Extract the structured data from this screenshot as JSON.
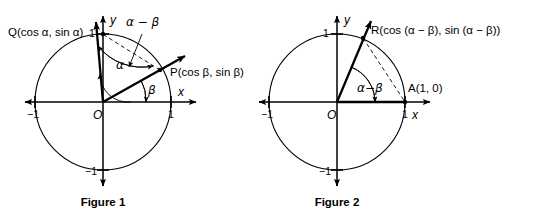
{
  "figures": [
    {
      "id": "figure-1",
      "caption": "Figure 1",
      "origin_label": "O",
      "x_axis_label": "x",
      "y_axis_label": "y",
      "ticks": {
        "x_neg": "−1",
        "x_pos": "1",
        "y_pos": "1",
        "y_neg": "−1"
      },
      "points": [
        {
          "name": "Q",
          "label": "Q(cos α, sin α)",
          "angle_deg": 84
        },
        {
          "name": "P",
          "label": "P(cos β, sin β)",
          "angle_deg": 29
        }
      ],
      "angles": [
        {
          "name": "alpha",
          "label": "α"
        },
        {
          "name": "beta",
          "label": "β"
        },
        {
          "name": "alpha-minus-beta",
          "label": "α − β"
        }
      ]
    },
    {
      "id": "figure-2",
      "caption": "Figure 2",
      "origin_label": "O",
      "x_axis_label": "x",
      "y_axis_label": "y",
      "ticks": {
        "x_neg": "−1",
        "x_pos": "1",
        "y_pos": "1",
        "y_neg": "−1"
      },
      "points": [
        {
          "name": "R",
          "label": "R(cos (α − β), sin (α − β))",
          "angle_deg": 68
        },
        {
          "name": "A",
          "label": "A(1, 0)",
          "angle_deg": 0
        }
      ],
      "angles": [
        {
          "name": "alpha-minus-beta",
          "label": "α−β"
        }
      ]
    }
  ],
  "colors": {
    "stroke": "#000000",
    "background": "#ffffff"
  }
}
